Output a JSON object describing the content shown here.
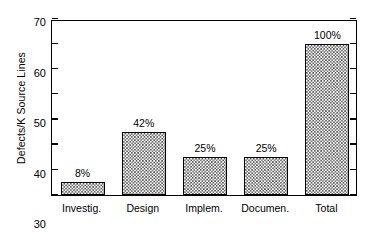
{
  "chart_data": {
    "type": "bar",
    "title": "",
    "xlabel": "",
    "ylabel": "Defects/K Source Lines",
    "ylim": [
      0,
      70
    ],
    "yticks": [
      0,
      10,
      20,
      30,
      40,
      50,
      60,
      70
    ],
    "grid": false,
    "legend": null,
    "categories": [
      "Investig.",
      "Design",
      "Implem.",
      "Documen.",
      "Total"
    ],
    "values": [
      5,
      25,
      15,
      15,
      60
    ],
    "data_labels": [
      "8%",
      "42%",
      "25%",
      "25%",
      "100%"
    ],
    "bar_style": {
      "pattern": "checkerboard",
      "fill_color": "#555555",
      "background_color": "#ffffff",
      "edge_color": "#000000"
    }
  },
  "figure": {
    "background_color": "#ffffff",
    "axis_color": "#000000"
  }
}
